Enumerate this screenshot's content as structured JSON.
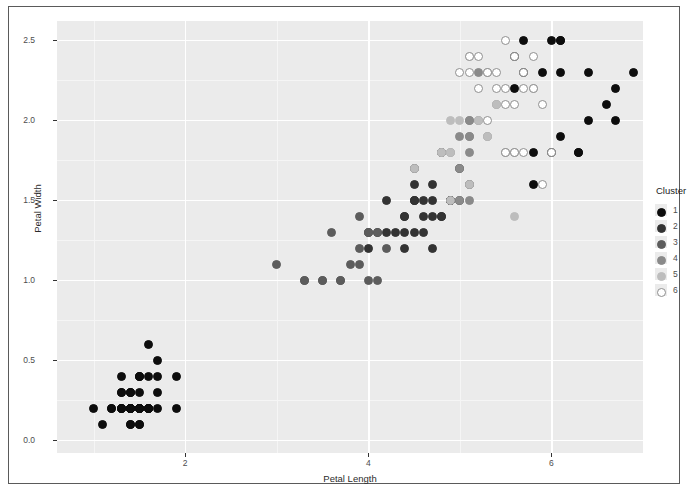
{
  "chart_data": {
    "type": "scatter",
    "title": "",
    "xlabel": "Petal Length",
    "ylabel": "Petal Width",
    "xlim": [
      0.6,
      7.0
    ],
    "ylim": [
      -0.08,
      2.62
    ],
    "xticks": [
      2,
      4,
      6
    ],
    "xticklabels": [
      "2",
      "4",
      "6"
    ],
    "yticks": [
      0.0,
      0.5,
      1.0,
      1.5,
      2.0,
      2.5
    ],
    "yticklabels": [
      "0.0",
      "0.5",
      "1.0",
      "1.5",
      "2.0",
      "2.5"
    ],
    "grid": true,
    "legend": {
      "title": "Cluster",
      "position": "right",
      "entries": [
        {
          "label": "1",
          "color": "#0d0d0d"
        },
        {
          "label": "2",
          "color": "#333333"
        },
        {
          "label": "3",
          "color": "#5c5c5c"
        },
        {
          "label": "4",
          "color": "#8a8a8a"
        },
        {
          "label": "5",
          "color": "#bdbdbd"
        },
        {
          "label": "6",
          "color": "#ffffff"
        }
      ]
    },
    "series": [
      {
        "name": "1",
        "color": "#0d0d0d",
        "points": [
          [
            1.4,
            0.2
          ],
          [
            1.4,
            0.2
          ],
          [
            1.3,
            0.2
          ],
          [
            1.5,
            0.2
          ],
          [
            1.4,
            0.2
          ],
          [
            1.7,
            0.4
          ],
          [
            1.4,
            0.3
          ],
          [
            1.5,
            0.2
          ],
          [
            1.4,
            0.2
          ],
          [
            1.5,
            0.1
          ],
          [
            1.5,
            0.2
          ],
          [
            1.6,
            0.2
          ],
          [
            1.4,
            0.1
          ],
          [
            1.1,
            0.1
          ],
          [
            1.2,
            0.2
          ],
          [
            1.5,
            0.4
          ],
          [
            1.3,
            0.4
          ],
          [
            1.4,
            0.3
          ],
          [
            1.7,
            0.3
          ],
          [
            1.5,
            0.3
          ],
          [
            1.7,
            0.2
          ],
          [
            1.5,
            0.4
          ],
          [
            1.0,
            0.2
          ],
          [
            1.7,
            0.5
          ],
          [
            1.9,
            0.2
          ],
          [
            1.6,
            0.2
          ],
          [
            1.6,
            0.4
          ],
          [
            1.5,
            0.2
          ],
          [
            1.4,
            0.2
          ],
          [
            1.6,
            0.2
          ],
          [
            1.6,
            0.2
          ],
          [
            1.5,
            0.4
          ],
          [
            1.5,
            0.1
          ],
          [
            1.4,
            0.2
          ],
          [
            1.5,
            0.2
          ],
          [
            1.2,
            0.2
          ],
          [
            1.3,
            0.2
          ],
          [
            1.4,
            0.1
          ],
          [
            1.3,
            0.2
          ],
          [
            1.5,
            0.2
          ],
          [
            1.3,
            0.3
          ],
          [
            1.3,
            0.3
          ],
          [
            1.3,
            0.2
          ],
          [
            1.6,
            0.6
          ],
          [
            1.9,
            0.4
          ],
          [
            1.4,
            0.3
          ],
          [
            1.6,
            0.2
          ],
          [
            1.4,
            0.2
          ],
          [
            1.5,
            0.2
          ],
          [
            1.4,
            0.2
          ],
          [
            6.0,
            2.5
          ],
          [
            6.1,
            2.5
          ],
          [
            6.6,
            2.1
          ],
          [
            6.3,
            1.8
          ],
          [
            6.1,
            1.9
          ],
          [
            6.4,
            2.0
          ],
          [
            6.7,
            2.2
          ],
          [
            6.9,
            2.3
          ],
          [
            5.7,
            2.5
          ],
          [
            6.7,
            2.0
          ],
          [
            6.0,
            1.8
          ],
          [
            6.1,
            2.3
          ],
          [
            5.9,
            2.3
          ],
          [
            6.1,
            2.5
          ],
          [
            5.6,
            2.4
          ],
          [
            5.8,
            1.6
          ],
          [
            5.6,
            2.2
          ],
          [
            6.4,
            2.3
          ],
          [
            5.8,
            1.8
          ],
          [
            5.7,
            2.3
          ],
          [
            6.3,
            1.8
          ]
        ]
      },
      {
        "name": "2",
        "color": "#333333",
        "points": [
          [
            4.7,
            1.4
          ],
          [
            4.9,
            1.5
          ],
          [
            4.6,
            1.5
          ],
          [
            4.7,
            1.6
          ],
          [
            4.6,
            1.3
          ],
          [
            4.4,
            1.4
          ],
          [
            4.5,
            1.5
          ],
          [
            4.9,
            1.5
          ],
          [
            4.7,
            1.2
          ],
          [
            4.4,
            1.4
          ],
          [
            4.8,
            1.4
          ],
          [
            5.0,
            1.7
          ],
          [
            4.5,
            1.5
          ],
          [
            4.6,
            1.4
          ],
          [
            4.7,
            1.5
          ],
          [
            4.4,
            1.3
          ],
          [
            4.5,
            1.3
          ],
          [
            4.5,
            1.6
          ],
          [
            4.8,
            1.8
          ],
          [
            4.9,
            1.5
          ],
          [
            4.5,
            1.5
          ],
          [
            4.2,
            1.5
          ],
          [
            4.2,
            1.3
          ],
          [
            4.3,
            1.3
          ],
          [
            4.4,
            1.2
          ],
          [
            4.1,
            1.3
          ],
          [
            4.0,
            1.3
          ],
          [
            4.0,
            1.2
          ],
          [
            5.1,
            1.6
          ],
          [
            4.5,
            1.7
          ],
          [
            4.8,
            1.4
          ],
          [
            5.0,
            1.5
          ]
        ]
      },
      {
        "name": "3",
        "color": "#5c5c5c",
        "points": [
          [
            3.9,
            1.4
          ],
          [
            3.9,
            1.2
          ],
          [
            3.5,
            1.0
          ],
          [
            3.8,
            1.1
          ],
          [
            3.7,
            1.0
          ],
          [
            3.6,
            1.3
          ],
          [
            4.0,
            1.0
          ],
          [
            3.3,
            1.0
          ],
          [
            3.5,
            1.0
          ],
          [
            4.1,
            1.0
          ],
          [
            3.0,
            1.1
          ],
          [
            4.2,
            1.2
          ],
          [
            3.3,
            1.0
          ],
          [
            4.0,
            1.3
          ],
          [
            3.9,
            1.1
          ],
          [
            4.1,
            1.3
          ],
          [
            4.0,
            1.3
          ],
          [
            3.7,
            1.0
          ]
        ]
      },
      {
        "name": "4",
        "color": "#8a8a8a",
        "points": [
          [
            5.1,
            1.9
          ],
          [
            5.3,
            1.9
          ],
          [
            5.1,
            2.0
          ],
          [
            5.2,
            2.0
          ],
          [
            5.0,
            1.9
          ],
          [
            5.1,
            1.8
          ],
          [
            5.0,
            1.7
          ],
          [
            5.1,
            1.5
          ],
          [
            4.9,
            1.8
          ],
          [
            5.4,
            2.1
          ],
          [
            5.6,
            1.8
          ],
          [
            5.1,
            2.0
          ],
          [
            5.5,
            1.8
          ],
          [
            4.8,
            1.8
          ],
          [
            5.2,
            2.3
          ],
          [
            5.0,
            1.5
          ],
          [
            5.1,
            1.9
          ],
          [
            5.3,
            2.3
          ]
        ]
      },
      {
        "name": "5",
        "color": "#bdbdbd",
        "points": [
          [
            5.6,
            1.4
          ],
          [
            5.1,
            1.6
          ],
          [
            5.0,
            2.0
          ],
          [
            4.9,
            2.0
          ],
          [
            5.1,
            2.4
          ],
          [
            4.5,
            1.7
          ],
          [
            4.9,
            1.8
          ],
          [
            5.2,
            2.0
          ],
          [
            5.3,
            1.9
          ],
          [
            5.4,
            2.1
          ],
          [
            4.8,
            1.8
          ],
          [
            4.9,
            1.5
          ]
        ]
      },
      {
        "name": "6",
        "color": "#ffffff",
        "points": [
          [
            5.8,
            2.2
          ],
          [
            5.6,
            2.4
          ],
          [
            5.5,
            2.1
          ],
          [
            5.3,
            2.3
          ],
          [
            5.5,
            1.8
          ],
          [
            5.0,
            2.3
          ],
          [
            5.1,
            2.3
          ],
          [
            5.4,
            2.3
          ],
          [
            5.1,
            2.4
          ],
          [
            5.9,
            2.1
          ],
          [
            5.7,
            2.3
          ],
          [
            5.2,
            2.4
          ],
          [
            5.4,
            2.2
          ],
          [
            5.6,
            2.1
          ],
          [
            5.8,
            2.4
          ],
          [
            5.6,
            1.8
          ],
          [
            5.7,
            1.8
          ],
          [
            6.0,
            1.8
          ],
          [
            5.2,
            2.2
          ],
          [
            5.9,
            1.6
          ],
          [
            5.5,
            2.2
          ],
          [
            5.5,
            2.5
          ],
          [
            5.3,
            2.0
          ],
          [
            5.8,
            2.2
          ],
          [
            5.7,
            2.2
          ]
        ]
      }
    ]
  },
  "panel": {
    "bg_color": "#ebebeb",
    "grid_color": "#ffffff",
    "minor_grid_color": "#f5f5f5"
  },
  "frame": {
    "border_color": "#5a5a5a",
    "bg_color": "#ffffff"
  }
}
